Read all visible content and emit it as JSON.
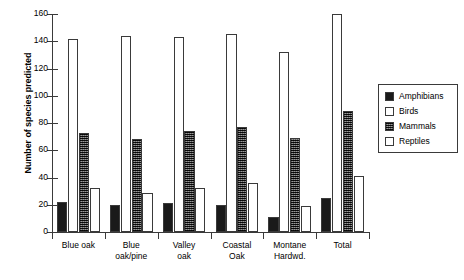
{
  "chart_data": {
    "type": "bar",
    "title": "",
    "subtitle": "",
    "xlabel": "",
    "ylabel": "Number of species predicted",
    "ylim": [
      0,
      160
    ],
    "ytick_step": 20,
    "yticks": [
      0,
      20,
      40,
      60,
      80,
      100,
      120,
      140,
      160
    ],
    "grid": false,
    "legend_position": "right",
    "categories": [
      "Blue oak",
      "Blue oak/pine",
      "Valley oak",
      "Coastal Oak",
      "Montane Hardwd.",
      "Total"
    ],
    "category_lines": [
      [
        "Blue oak"
      ],
      [
        "Blue",
        "oak/pine"
      ],
      [
        "Valley",
        "oak"
      ],
      [
        "Coastal",
        "Oak"
      ],
      [
        "Montane",
        "Hardwd."
      ],
      [
        "Total"
      ]
    ],
    "series": [
      {
        "name": "Amphibians",
        "fill": "solid-black",
        "color": "#1a1a1a",
        "values": [
          22,
          20,
          21,
          20,
          11,
          25
        ]
      },
      {
        "name": "Birds",
        "fill": "white",
        "color": "#ffffff",
        "values": [
          142,
          144,
          143,
          145,
          132,
          160
        ]
      },
      {
        "name": "Mammals",
        "fill": "dark-hatched",
        "color": "#4a4a4a",
        "values": [
          73,
          68,
          74,
          77,
          69,
          89
        ]
      },
      {
        "name": "Reptiles",
        "fill": "white",
        "color": "#ffffff",
        "values": [
          32,
          29,
          32,
          36,
          19,
          41
        ]
      }
    ]
  },
  "legend": {
    "items": [
      {
        "label": "Amphibians"
      },
      {
        "label": "Birds"
      },
      {
        "label": "Mammals"
      },
      {
        "label": "Reptiles"
      }
    ]
  },
  "colors": {
    "axis": "#3a3a3a",
    "text": "#000000",
    "background": "#ffffff"
  }
}
